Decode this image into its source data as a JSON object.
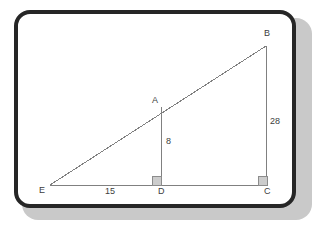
{
  "figure": {
    "type": "geometry-diagram",
    "frame": {
      "border_color": "#262626",
      "fill_color": "#ffffff",
      "shadow_color": "#c9c9c9"
    },
    "style": {
      "line_color": "#808080",
      "line_width": 1,
      "label_color": "#3d3d3d",
      "right_angle_fill": "#cccccc",
      "right_angle_stroke": "#8c8c8c"
    },
    "points": [
      {
        "name": "E",
        "label": "E",
        "x": 50,
        "y": 185,
        "label_x": 39,
        "label_y": 186
      },
      {
        "name": "D",
        "label": "D",
        "x": 161,
        "y": 185,
        "label_x": 158,
        "label_y": 187
      },
      {
        "name": "C",
        "label": "C",
        "x": 267,
        "y": 185,
        "label_x": 264,
        "label_y": 187
      },
      {
        "name": "A",
        "label": "A",
        "x": 161,
        "y": 107,
        "label_x": 152,
        "label_y": 96
      },
      {
        "name": "B",
        "label": "B",
        "x": 266,
        "y": 46,
        "label_x": 264,
        "label_y": 29
      }
    ],
    "segments": [
      {
        "name": "base-EC",
        "from": "E",
        "to": "C"
      },
      {
        "name": "hypotenuse-EB",
        "from": "E",
        "to": "B"
      },
      {
        "name": "altitude-AD",
        "from": "A",
        "to": "D"
      },
      {
        "name": "leg-BC",
        "from": "B",
        "to": "C"
      }
    ],
    "right_angles": [
      {
        "name": "right-angle-at-D",
        "x": 152,
        "y": 176,
        "size": 9
      },
      {
        "name": "right-angle-at-C",
        "x": 258,
        "y": 176,
        "size": 9
      }
    ],
    "measures": [
      {
        "name": "measure-ED",
        "label": "15",
        "segment": "E-D",
        "value": 15,
        "label_x": 105,
        "label_y": 187
      },
      {
        "name": "measure-AD",
        "label": "8",
        "segment": "A-D",
        "value": 8,
        "label_x": 166,
        "label_y": 137
      },
      {
        "name": "measure-BC",
        "label": "28",
        "segment": "B-C",
        "value": 28,
        "label_x": 270,
        "label_y": 117
      }
    ]
  }
}
